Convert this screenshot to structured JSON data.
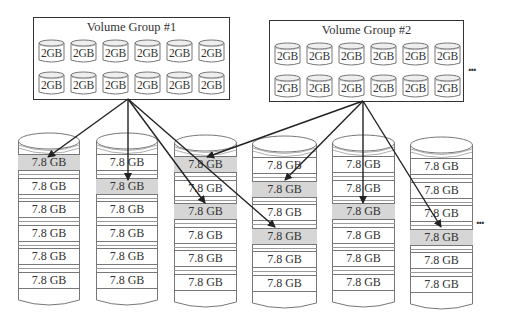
{
  "volume_groups": [
    {
      "title": "Volume Group #1",
      "disks": [
        "2GB",
        "2GB",
        "2GB",
        "2GB",
        "2GB",
        "2GB",
        "2GB",
        "2GB",
        "2GB",
        "2GB",
        "2GB",
        "2GB"
      ]
    },
    {
      "title": "Volume Group #2",
      "disks": [
        "2GB",
        "2GB",
        "2GB",
        "2GB",
        "2GB",
        "2GB",
        "2GB",
        "2GB",
        "2GB",
        "2GB",
        "2GB",
        "2GB"
      ]
    }
  ],
  "top_ellipsis": "...",
  "bottom_ellipsis": "...",
  "physical_disks": [
    {
      "segments": [
        "7.8 GB",
        "7.8 GB",
        "7.8 GB",
        "7.8 GB",
        "7.8 GB",
        "7.8 GB"
      ],
      "highlighted": [
        0
      ]
    },
    {
      "segments": [
        "7.8 GB",
        "7.8 GB",
        "7.8 GB",
        "7.8 GB",
        "7.8 GB",
        "7.8 GB"
      ],
      "highlighted": [
        1
      ]
    },
    {
      "segments": [
        "7.8 GB",
        "7.8 GB",
        "7.8 GB",
        "7.8 GB",
        "7.8 GB",
        "7.8 GB"
      ],
      "highlighted": [
        0,
        2
      ]
    },
    {
      "segments": [
        "7.8 GB",
        "7.8 GB",
        "7.8 GB",
        "7.8 GB",
        "7.8 GB",
        "7.8 GB"
      ],
      "highlighted": [
        1,
        3
      ]
    },
    {
      "segments": [
        "7.8 GB",
        "7.8 GB",
        "7.8 GB",
        "7.8 GB",
        "7.8 GB",
        "7.8 GB"
      ],
      "highlighted": [
        2
      ]
    },
    {
      "segments": [
        "7.8 GB",
        "7.8 GB",
        "7.8 GB",
        "7.8 GB",
        "7.8 GB",
        "7.8 GB"
      ],
      "highlighted": [
        3
      ]
    }
  ],
  "mappings": [
    {
      "from": "Volume Group #1",
      "to_disk": 1,
      "segment": 1
    },
    {
      "from": "Volume Group #1",
      "to_disk": 2,
      "segment": 2
    },
    {
      "from": "Volume Group #1",
      "to_disk": 3,
      "segment": 3
    },
    {
      "from": "Volume Group #1",
      "to_disk": 4,
      "segment": 4
    },
    {
      "from": "Volume Group #2",
      "to_disk": 3,
      "segment": 1
    },
    {
      "from": "Volume Group #2",
      "to_disk": 4,
      "segment": 2
    },
    {
      "from": "Volume Group #2",
      "to_disk": 5,
      "segment": 3
    },
    {
      "from": "Volume Group #2",
      "to_disk": 6,
      "segment": 4
    }
  ],
  "colors": {
    "highlight": "#d6d6d6",
    "line": "#222222"
  }
}
